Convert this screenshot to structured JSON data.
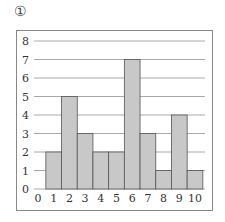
{
  "figure_label": "①",
  "chart_data": {
    "type": "bar",
    "title": "",
    "xlabel": "",
    "ylabel": "",
    "categories": [
      "0",
      "1",
      "2",
      "3",
      "4",
      "5",
      "6",
      "7",
      "8",
      "9",
      "10"
    ],
    "values": [
      0,
      2,
      5,
      3,
      2,
      2,
      7,
      3,
      1,
      4,
      1
    ],
    "x_ticks": [
      "0",
      "1",
      "2",
      "3",
      "4",
      "5",
      "6",
      "7",
      "8",
      "9",
      "10"
    ],
    "y_ticks": [
      "0",
      "1",
      "2",
      "3",
      "4",
      "5",
      "6",
      "7",
      "8"
    ],
    "ylim": [
      0,
      8
    ],
    "grid": true,
    "legend": null,
    "bar_color": "#c8c8c8",
    "bar_edge_color": "#555555",
    "grid_color": "#aaaaaa"
  }
}
